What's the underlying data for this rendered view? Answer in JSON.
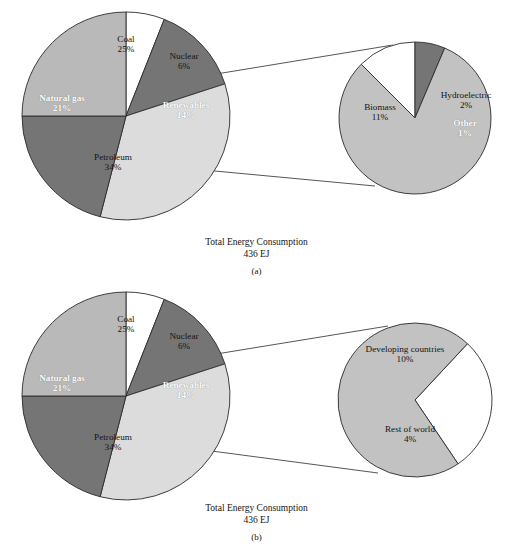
{
  "page": {
    "width": 513,
    "height": 560,
    "background": "#ffffff"
  },
  "palette": {
    "white": "#ffffff",
    "light_gray": "#dcdcdc",
    "medium_gray": "#b9b9b9",
    "inset_gray": "#c2c2c2",
    "dark_gray": "#757575",
    "outline": "#2b2b2b"
  },
  "panels": [
    {
      "id": "a",
      "letter": "(a)",
      "caption_title": "Total Energy Consumption",
      "caption_value": "436 EJ",
      "main_pie": {
        "cx": 126,
        "cy": 116,
        "r": 104,
        "slices": [
          {
            "key": "nuclear",
            "name": "Nuclear",
            "pct": 6,
            "pct_label": "6%",
            "color": "#ffffff",
            "label_style": "normal",
            "lx": 184,
            "ly": 62,
            "explode": false
          },
          {
            "key": "renewables",
            "name": "Renewables",
            "pct": 14,
            "pct_label": "14%",
            "color": "#757575",
            "label_style": "inverse",
            "lx": 186,
            "ly": 111,
            "explode": true
          },
          {
            "key": "petroleum",
            "name": "Petroleum",
            "pct": 34,
            "pct_label": "34%",
            "color": "#dcdcdc",
            "label_style": "normal",
            "lx": 113,
            "ly": 163,
            "explode": false
          },
          {
            "key": "natural_gas",
            "name": "Natural gas",
            "pct": 21,
            "pct_label": "21%",
            "color": "#757575",
            "label_style": "inverse",
            "lx": 62,
            "ly": 104,
            "explode": false
          },
          {
            "key": "coal",
            "name": "Coal",
            "pct": 25,
            "pct_label": "25%",
            "color": "#b9b9b9",
            "label_style": "normal",
            "lx": 126,
            "ly": 45,
            "explode": false
          }
        ]
      },
      "inset_pie": {
        "cx": 415,
        "cy": 118,
        "r": 76,
        "start_angle_deg": -45,
        "slices": [
          {
            "key": "hydroelectric",
            "name": "Hydroelectric",
            "pct": 2,
            "pct_label": "2%",
            "color": "#ffffff",
            "label_style": "normal",
            "span_deg": 45,
            "lx": 466,
            "ly": 101
          },
          {
            "key": "other",
            "name": "Other",
            "pct": 1,
            "pct_label": "1%",
            "color": "#757575",
            "label_style": "inverse",
            "span_deg": 23,
            "lx": 465,
            "ly": 129
          },
          {
            "key": "biomass",
            "name": "Biomass",
            "pct": 11,
            "pct_label": "11%",
            "color": "#c2c2c2",
            "label_style": "normal",
            "span_deg": 292,
            "lx": 380,
            "ly": 113
          }
        ]
      },
      "connectors": [
        {
          "from": [
            204,
            76
          ],
          "to": [
            393,
            45
          ]
        },
        {
          "from": [
            204,
            170
          ],
          "to": [
            375,
            186
          ]
        }
      ]
    },
    {
      "id": "b",
      "letter": "(b)",
      "caption_title": "Total Energy Consumption",
      "caption_value": "436 EJ",
      "main_pie": {
        "cx": 126,
        "cy": 116,
        "r": 104,
        "slices": [
          {
            "key": "nuclear",
            "name": "Nuclear",
            "pct": 6,
            "pct_label": "6%",
            "color": "#ffffff",
            "label_style": "normal",
            "lx": 184,
            "ly": 62,
            "explode": false
          },
          {
            "key": "renewables",
            "name": "Renewables",
            "pct": 14,
            "pct_label": "14%",
            "color": "#757575",
            "label_style": "inverse",
            "lx": 186,
            "ly": 111,
            "explode": true
          },
          {
            "key": "petroleum",
            "name": "Petroleum",
            "pct": 34,
            "pct_label": "34%",
            "color": "#dcdcdc",
            "label_style": "normal",
            "lx": 113,
            "ly": 163,
            "explode": false
          },
          {
            "key": "natural_gas",
            "name": "Natural gas",
            "pct": 21,
            "pct_label": "21%",
            "color": "#757575",
            "label_style": "inverse",
            "lx": 62,
            "ly": 104,
            "explode": false
          },
          {
            "key": "coal",
            "name": "Coal",
            "pct": 25,
            "pct_label": "25%",
            "color": "#b9b9b9",
            "label_style": "normal",
            "lx": 126,
            "ly": 45,
            "explode": false
          }
        ]
      },
      "inset_pie": {
        "cx": 415,
        "cy": 120,
        "r": 77,
        "start_angle_deg": 43,
        "slices": [
          {
            "key": "rest_of_world",
            "name": "Rest of world",
            "pct": 4,
            "pct_label": "4%",
            "color": "#ffffff",
            "label_style": "normal",
            "span_deg": 103,
            "lx": 410,
            "ly": 155
          },
          {
            "key": "developing_countries",
            "name": "Developing countries",
            "pct": 10,
            "pct_label": "10%",
            "color": "#c2c2c2",
            "label_style": "normal",
            "span_deg": 257,
            "lx": 405,
            "ly": 75
          }
        ]
      },
      "connectors": [
        {
          "from": [
            204,
            76
          ],
          "to": [
            388,
            46
          ]
        },
        {
          "from": [
            204,
            170
          ],
          "to": [
            378,
            193
          ]
        }
      ]
    }
  ],
  "chart_data": {
    "type": "pie",
    "title": "Total Energy Consumption",
    "subtitle": "436 EJ",
    "unit": "percent of total energy consumption",
    "total_label": "436 EJ",
    "charts": [
      {
        "panel": "(a)",
        "main": {
          "categories": [
            "Nuclear",
            "Renewables",
            "Petroleum",
            "Natural gas",
            "Coal"
          ],
          "values": [
            6,
            14,
            34,
            21,
            25
          ],
          "colors": [
            "#ffffff",
            "#757575",
            "#dcdcdc",
            "#757575",
            "#b9b9b9"
          ]
        },
        "breakout_of": "Renewables",
        "breakout": {
          "categories": [
            "Hydroelectric",
            "Other",
            "Biomass"
          ],
          "values": [
            2,
            1,
            11
          ],
          "colors": [
            "#ffffff",
            "#757575",
            "#c2c2c2"
          ]
        }
      },
      {
        "panel": "(b)",
        "main": {
          "categories": [
            "Nuclear",
            "Renewables",
            "Petroleum",
            "Natural gas",
            "Coal"
          ],
          "values": [
            6,
            14,
            34,
            21,
            25
          ],
          "colors": [
            "#ffffff",
            "#757575",
            "#dcdcdc",
            "#757575",
            "#b9b9b9"
          ]
        },
        "breakout_of": "Renewables",
        "breakout": {
          "categories": [
            "Rest of world",
            "Developing countries"
          ],
          "values": [
            4,
            10
          ],
          "colors": [
            "#ffffff",
            "#c2c2c2"
          ]
        }
      }
    ]
  }
}
